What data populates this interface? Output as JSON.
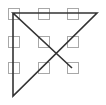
{
  "diagram": {
    "type": "nine-dots-puzzle-solution",
    "background": "#ffffff",
    "box_color": "#a8a8a8",
    "line_color": "#333333",
    "box_size": 11,
    "boxes": [
      {
        "x": 8,
        "y": 8
      },
      {
        "x": 38,
        "y": 8
      },
      {
        "x": 67,
        "y": 8
      },
      {
        "x": 8,
        "y": 36
      },
      {
        "x": 38,
        "y": 36
      },
      {
        "x": 67,
        "y": 36
      },
      {
        "x": 8,
        "y": 62
      },
      {
        "x": 38,
        "y": 62
      },
      {
        "x": 67,
        "y": 62
      }
    ],
    "path": [
      {
        "x": 72,
        "y": 68
      },
      {
        "x": 13,
        "y": 13
      },
      {
        "x": 97,
        "y": 13
      },
      {
        "x": 13,
        "y": 96
      },
      {
        "x": 13,
        "y": 13
      }
    ]
  }
}
